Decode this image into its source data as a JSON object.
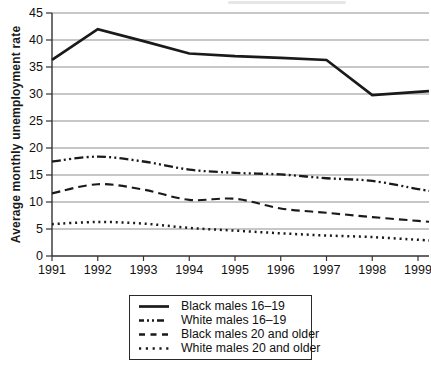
{
  "figure": {
    "kind": "statistical line chart",
    "title": ""
  },
  "chart_data": {
    "type": "line",
    "title": "",
    "xlabel": "",
    "ylabel": "Average monthly unemployment rate",
    "categories": [
      "1991",
      "1992",
      "1993",
      "1994",
      "1995",
      "1996",
      "1997",
      "1998",
      "1999"
    ],
    "ylim": [
      0,
      45
    ],
    "yticks": [
      0,
      5,
      10,
      15,
      20,
      25,
      30,
      35,
      40,
      45
    ],
    "grid": "horizontal",
    "legend_position": "bottom-center-boxed",
    "line_color": "#1a1a1a",
    "grid_color": "#909090",
    "axis_color": "#333333",
    "series": [
      {
        "name": "Black males 16–19",
        "style": "solid",
        "smooth": false,
        "values": [
          36.3,
          42.0,
          39.8,
          37.5,
          37.0,
          36.7,
          36.3,
          29.8,
          30.4
        ]
      },
      {
        "name": "White males 16–19",
        "style": "dash-dot-dot",
        "smooth": true,
        "values": [
          17.5,
          18.4,
          17.5,
          16.0,
          15.4,
          15.1,
          14.4,
          13.9,
          12.4
        ]
      },
      {
        "name": "Black males 20 and older",
        "style": "dashed",
        "smooth": true,
        "values": [
          11.6,
          13.3,
          12.3,
          10.4,
          10.6,
          8.8,
          8.0,
          7.2,
          6.5
        ]
      },
      {
        "name": "White males 20 and older",
        "style": "dotted",
        "smooth": true,
        "values": [
          5.9,
          6.3,
          6.0,
          5.2,
          4.7,
          4.2,
          3.8,
          3.5,
          3.0
        ]
      }
    ]
  }
}
